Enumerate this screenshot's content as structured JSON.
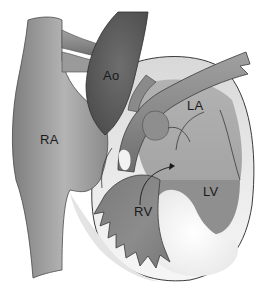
{
  "diagram": {
    "type": "anatomical-heart-illustration",
    "labels": {
      "ra": "RA",
      "ao": "Ao",
      "la": "LA",
      "lv": "LV",
      "rv": "RV"
    },
    "colors": {
      "background": "#ffffff",
      "pericardium": "#e6e6e6",
      "vessel": "#8c8c8c",
      "aorta": "#5e5e5e",
      "atrium": "#a8a8a8",
      "ventricle": "#8a8a8a",
      "outline": "#3a3a3a"
    }
  }
}
